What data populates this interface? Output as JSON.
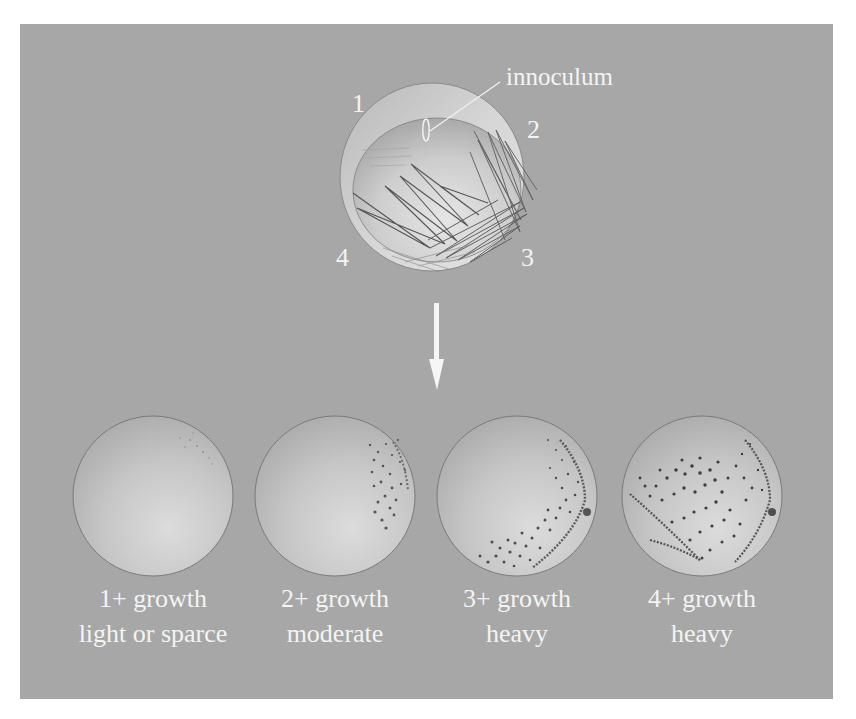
{
  "figure": {
    "background_color": "#a7a7a7",
    "label_color": "#f4f4f4",
    "inoculation_plate": {
      "callout_label": "innoculum",
      "quadrants": [
        {
          "number": "1"
        },
        {
          "number": "2"
        },
        {
          "number": "3"
        },
        {
          "number": "4"
        }
      ]
    },
    "arrow": {
      "direction": "down",
      "icon": "arrow-down-icon"
    },
    "growth_plates": [
      {
        "grade": "1+ growth",
        "description": "light or sparce"
      },
      {
        "grade": "2+ growth",
        "description": "moderate"
      },
      {
        "grade": "3+ growth",
        "description": "heavy"
      },
      {
        "grade": "4+ growth",
        "description": "heavy"
      }
    ]
  }
}
